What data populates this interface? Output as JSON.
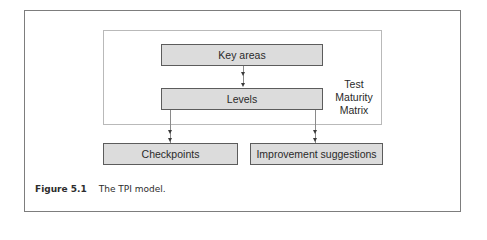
{
  "diagram": {
    "type": "flow",
    "container_label": "Test Maturity Matrix",
    "container_label_lines": [
      "Test",
      "Maturity",
      "Matrix"
    ],
    "nodes": [
      {
        "id": "key_areas",
        "label": "Key areas"
      },
      {
        "id": "levels",
        "label": "Levels"
      },
      {
        "id": "checkpoints",
        "label": "Checkpoints"
      },
      {
        "id": "improvement",
        "label": "Improvement suggestions"
      }
    ],
    "edges": [
      {
        "from": "key_areas",
        "to": "levels"
      },
      {
        "from": "levels",
        "to": "checkpoints"
      },
      {
        "from": "levels",
        "to": "improvement"
      }
    ],
    "colors": {
      "box_fill": "#dcdcdc",
      "box_border": "#5c5c5c",
      "frame_border": "#7d7d7d"
    }
  },
  "caption": {
    "figure_number": "Figure 5.1",
    "text": "The TPI model."
  }
}
